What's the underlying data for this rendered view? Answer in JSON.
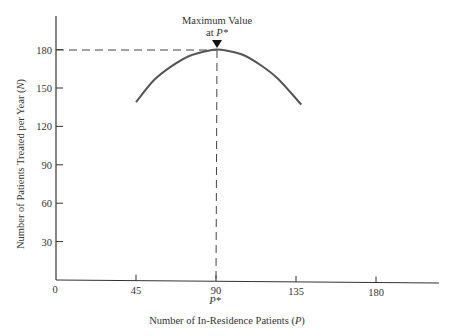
{
  "chart_data": {
    "type": "line",
    "title": "",
    "xlabel": "Number of In-Residence Patients (P)",
    "xlabel_parts": {
      "text": "Number of In-Residence Patients (",
      "var": "P",
      "close": ")"
    },
    "ylabel": "Number of Patients Treated per Year (N)",
    "ylabel_parts": {
      "text": "Number of Patients Treated per Year (",
      "var": "N",
      "close": ")"
    },
    "xlim": [
      0,
      210
    ],
    "ylim": [
      0,
      200
    ],
    "x_ticks": [
      0,
      45,
      90,
      135,
      180
    ],
    "x_tick_labels": [
      "0",
      "45",
      "90",
      "135",
      "180"
    ],
    "y_ticks": [
      30,
      60,
      90,
      120,
      150,
      180
    ],
    "y_tick_labels": [
      "30",
      "60",
      "90",
      "120",
      "150",
      "180"
    ],
    "grid": false,
    "series": [
      {
        "name": "N(P)",
        "x": [
          45,
          55,
          65,
          75,
          85,
          90,
          95,
          105,
          115,
          125,
          138
        ],
        "y": [
          139,
          156,
          167,
          175,
          179,
          180,
          179.5,
          176,
          168,
          157,
          137
        ]
      }
    ],
    "annotations": [
      {
        "text": "Maximum Value",
        "line2": "at P*",
        "line2_prefix": "at ",
        "line2_var": "P*",
        "x": 90,
        "y": 180,
        "marker": "down-triangle"
      },
      {
        "text": "P*",
        "x": 90,
        "position": "below x-axis tick label"
      }
    ],
    "reference_lines": [
      {
        "type": "horizontal-dashed",
        "y": 180,
        "from_x": 0,
        "to_x": 90
      },
      {
        "type": "vertical-dashed",
        "x": 90,
        "from_y": 0,
        "to_y": 180
      }
    ],
    "colors": {
      "curve": "#555555",
      "axes": "#333333",
      "dashes": "#444444"
    }
  }
}
